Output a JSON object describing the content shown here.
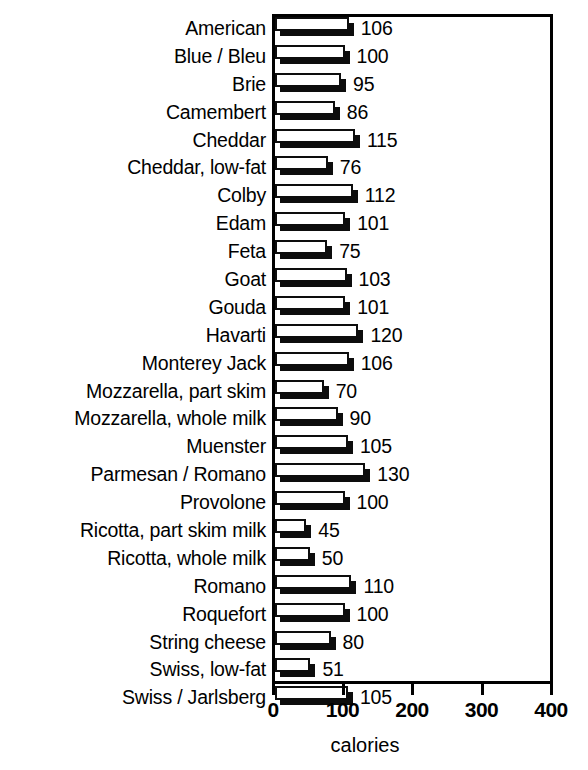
{
  "chart_data": {
    "type": "bar",
    "orientation": "horizontal",
    "title": "",
    "subtitle": "",
    "xlabel": "calories",
    "ylabel": "",
    "xlim": [
      0,
      400
    ],
    "xticks": [
      0,
      100,
      200,
      300,
      400
    ],
    "xticklabels": [
      "0",
      "100",
      "200",
      "300",
      "400"
    ],
    "grid": false,
    "legend": null,
    "value_labels_shown": true,
    "categories": [
      "American",
      "Blue / Bleu",
      "Brie",
      "Camembert",
      "Cheddar",
      "Cheddar, low-fat",
      "Colby",
      "Edam",
      "Feta",
      "Goat",
      "Gouda",
      "Havarti",
      "Monterey Jack",
      "Mozzarella, part skim",
      "Mozzarella, whole milk",
      "Muenster",
      "Parmesan / Romano",
      "Provolone",
      "Ricotta, part skim milk",
      "Ricotta, whole milk",
      "Romano",
      "Roquefort",
      "String cheese",
      "Swiss, low-fat",
      "Swiss / Jarlsberg"
    ],
    "values": [
      106,
      100,
      95,
      86,
      115,
      76,
      112,
      101,
      75,
      103,
      101,
      120,
      106,
      70,
      90,
      105,
      130,
      100,
      45,
      50,
      110,
      100,
      80,
      51,
      105
    ],
    "value_label_texts": [
      "106",
      "100",
      "95",
      "86",
      "115",
      "76",
      "112",
      "101",
      "75",
      "103",
      "101",
      "120",
      "106",
      "70",
      "90",
      "105",
      "130",
      "100",
      "45",
      "50",
      "110",
      "100",
      "80",
      "51",
      "105"
    ],
    "colors": {
      "bar_face": "#ffffff",
      "bar_outline": "#0d0d0d",
      "bar_shadow": "#0d0d0d",
      "axis": "#000000",
      "text": "#000000",
      "background": "#ffffff"
    }
  }
}
